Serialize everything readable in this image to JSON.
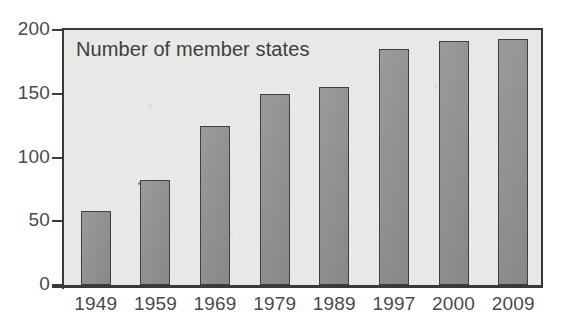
{
  "chart_data": {
    "type": "bar",
    "title": "Number of member states",
    "xlabel": "",
    "ylabel": "",
    "categories": [
      "1949",
      "1959",
      "1969",
      "1979",
      "1989",
      "1997",
      "2000",
      "2009"
    ],
    "values": [
      58,
      82,
      125,
      150,
      155,
      185,
      191,
      193
    ],
    "ylim": [
      0,
      200
    ],
    "yticks": [
      0,
      50,
      100,
      150,
      200
    ],
    "ytick_labels": [
      "0",
      "50",
      "100",
      "150",
      "200"
    ],
    "grid": false,
    "legend": false,
    "legend_position": "none",
    "series": [
      {
        "name": "Number of member states",
        "values": [
          58,
          82,
          125,
          150,
          155,
          185,
          191,
          193
        ]
      }
    ],
    "colors": {
      "bar_fill": "#8f8f8d",
      "bar_border": "#3f3f3f",
      "plot_background": "#e8e8e6",
      "axis": "#3a3a3a",
      "text": "#4a4a4a",
      "figure_background": "#ffffff"
    }
  }
}
